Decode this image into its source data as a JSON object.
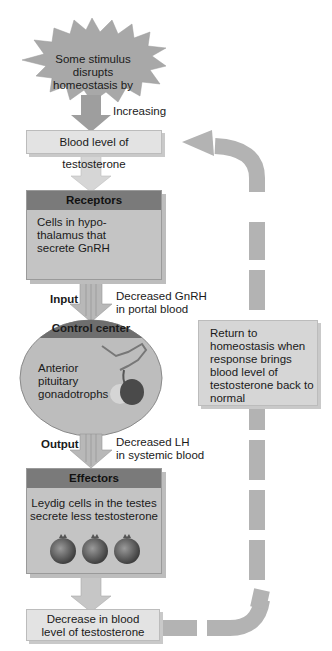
{
  "stimulus": {
    "text_line1": "Some stimulus disrupts",
    "text_line2": "homeostasis by"
  },
  "arrow_label_increasing": "Increasing",
  "blood_level_box": "Blood level of testosterone",
  "receptors": {
    "title": "Receptors",
    "line1": "Cells in hypo-",
    "line2": "thalamus that",
    "line3": "secrete GnRH"
  },
  "input": {
    "label": "Input",
    "desc_line1": "Decreased GnRH",
    "desc_line2": "in portal blood"
  },
  "control_center": {
    "title": "Control center",
    "line1": "Anterior",
    "line2": "pituitary",
    "line3": "gonadotrophs"
  },
  "output": {
    "label": "Output",
    "desc_line1": "Decreased LH",
    "desc_line2": "in systemic blood"
  },
  "effectors": {
    "title": "Effectors",
    "line1": "Leydig cells in the testes",
    "line2": "secrete less testosterone"
  },
  "decrease_box": {
    "line1": "Decrease in blood",
    "line2": "level of testosterone"
  },
  "return_box": {
    "line1": "Return to",
    "line2": "homeostasis when",
    "line3": "response brings",
    "line4": "blood level of",
    "line5": "testosterone back to",
    "line6": "normal"
  },
  "colors": {
    "arrow": "#b5b5b5",
    "panel": "#c4c4c4",
    "panel_header": "#7a7a7a",
    "light_box": "#e3e3e3",
    "cell": "#555555"
  }
}
